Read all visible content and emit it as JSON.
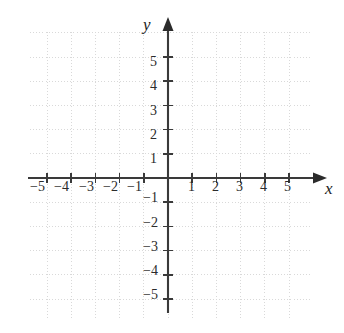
{
  "figure": {
    "kind": "cartesian-coordinate-grid",
    "title": "",
    "background_color": "#ffffff",
    "axis_color": "#3a3a3a",
    "grid_color": "#d9d9d9",
    "label_color": "#2b2b2b"
  },
  "axes": {
    "x_label": "x",
    "y_label": "y",
    "x_arrow": "right-arrowhead",
    "y_arrow": "up-arrowhead"
  },
  "chart_data": {
    "type": "scatter",
    "title": "",
    "xlabel": "x",
    "ylabel": "y",
    "xlim": [
      -6,
      6
    ],
    "ylim": [
      -6,
      6
    ],
    "grid": true,
    "grid_style": "dotted",
    "legend": null,
    "x_ticks": [
      -5,
      -4,
      -3,
      -2,
      -1,
      1,
      2,
      3,
      4,
      5
    ],
    "y_ticks": [
      5,
      4,
      3,
      2,
      1,
      -1,
      -2,
      -3,
      -4,
      -5
    ],
    "x_tick_labels": [
      "−5",
      "−4",
      "−3",
      "−2",
      "−1",
      "1",
      "2",
      "3",
      "4",
      "5"
    ],
    "y_tick_labels": [
      "5",
      "4",
      "3",
      "2",
      "1",
      "−1",
      "−2",
      "−3",
      "−4",
      "−5"
    ],
    "series": [],
    "x": [],
    "values": [],
    "annotations": []
  },
  "x_axis_labels": [
    {
      "text": "−5",
      "value": -5,
      "left": 30,
      "top": 180
    },
    {
      "text": "−4",
      "value": -4,
      "left": 54,
      "top": 180
    },
    {
      "text": "−3",
      "value": -3,
      "left": 79,
      "top": 180
    },
    {
      "text": "−2",
      "value": -2,
      "left": 103,
      "top": 180
    },
    {
      "text": "−1",
      "value": -1,
      "left": 127,
      "top": 180
    },
    {
      "text": "1",
      "value": 1,
      "left": 188,
      "top": 180
    },
    {
      "text": "2",
      "value": 2,
      "left": 212,
      "top": 180
    },
    {
      "text": "3",
      "value": 3,
      "left": 236,
      "top": 180
    },
    {
      "text": "4",
      "value": 4,
      "left": 260,
      "top": 180
    },
    {
      "text": "5",
      "value": 5,
      "left": 284,
      "top": 180
    }
  ],
  "y_axis_labels": [
    {
      "text": "5",
      "value": 5,
      "left": 150,
      "top": 55
    },
    {
      "text": "4",
      "value": 4,
      "left": 150,
      "top": 79
    },
    {
      "text": "3",
      "value": 3,
      "left": 150,
      "top": 104
    },
    {
      "text": "2",
      "value": 2,
      "left": 150,
      "top": 128
    },
    {
      "text": "1",
      "value": 1,
      "left": 150,
      "top": 152
    },
    {
      "text": "−1",
      "value": -1,
      "left": 143,
      "top": 191
    },
    {
      "text": "−2",
      "value": -2,
      "left": 143,
      "top": 216
    },
    {
      "text": "−3",
      "value": -3,
      "left": 143,
      "top": 240
    },
    {
      "text": "−4",
      "value": -4,
      "left": 143,
      "top": 264
    },
    {
      "text": "−5",
      "value": -5,
      "left": 143,
      "top": 288
    }
  ]
}
